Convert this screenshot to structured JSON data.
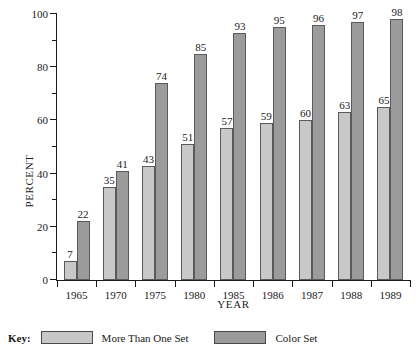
{
  "chart_data": {
    "type": "bar",
    "title": "",
    "xlabel": "YEAR",
    "ylabel": "PERCENT",
    "ylim": [
      0,
      100
    ],
    "y_major_ticks": [
      0,
      20,
      40,
      60,
      80,
      100
    ],
    "y_minor_ticks": [
      10,
      30,
      50,
      70,
      90
    ],
    "y_tick_labels": [
      "0",
      "20",
      "40",
      "60",
      "80",
      "100"
    ],
    "grid": false,
    "legend_position": "bottom-left",
    "categories": [
      "1965",
      "1970",
      "1975",
      "1980",
      "1985",
      "1986",
      "1987",
      "1988",
      "1989"
    ],
    "series": [
      {
        "name": "More Than One Set",
        "color": "#c8c8c8",
        "values": [
          7,
          35,
          43,
          51,
          57,
          59,
          60,
          63,
          65
        ]
      },
      {
        "name": "Color Set",
        "color": "#9b9b9b",
        "values": [
          22,
          41,
          74,
          85,
          93,
          95,
          96,
          97,
          98
        ]
      }
    ]
  },
  "legend": {
    "key_label": "Key:"
  }
}
